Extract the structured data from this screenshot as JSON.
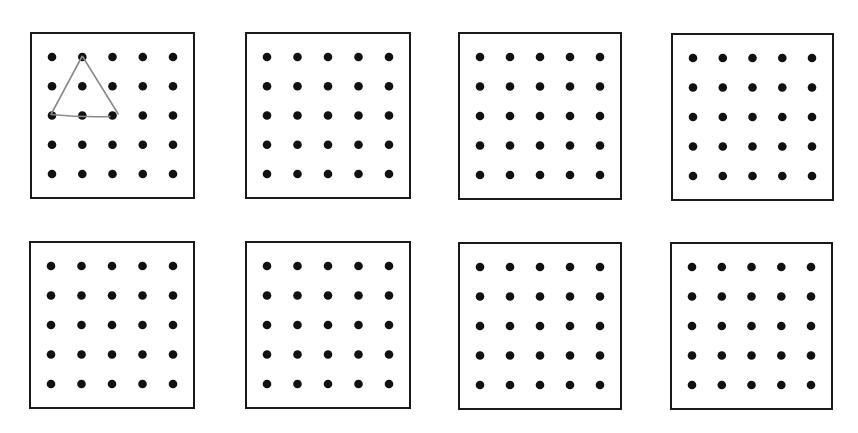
{
  "diagram": {
    "type": "dot-grid geoboards",
    "grid": {
      "rows": 5,
      "cols": 5
    },
    "colors": {
      "border": "#1a1a1a",
      "peg": "#111111",
      "shape_stroke": "#8a8a8a",
      "background": "#ffffff"
    },
    "boards": [
      {
        "id": 1,
        "box": {
          "x": 30,
          "y": 32,
          "w": 165,
          "h": 167
        },
        "shape": {
          "type": "triangle",
          "points_grid": [
            [
              1,
              0
            ],
            [
              0,
              2
            ],
            [
              2,
              2
            ]
          ],
          "description": "hand-drawn triangle connecting peg (col 1,row 0) to (col 0,row 2) to (col 2,row 2)"
        }
      },
      {
        "id": 2,
        "box": {
          "x": 245,
          "y": 32,
          "w": 166,
          "h": 167
        },
        "shape": null
      },
      {
        "id": 3,
        "box": {
          "x": 458,
          "y": 32,
          "w": 164,
          "h": 168
        },
        "shape": null
      },
      {
        "id": 4,
        "box": {
          "x": 671,
          "y": 33,
          "w": 163,
          "h": 168
        },
        "shape": null
      },
      {
        "id": 5,
        "box": {
          "x": 29,
          "y": 241,
          "w": 166,
          "h": 168
        },
        "shape": null
      },
      {
        "id": 6,
        "box": {
          "x": 245,
          "y": 241,
          "w": 166,
          "h": 168
        },
        "shape": null
      },
      {
        "id": 7,
        "box": {
          "x": 458,
          "y": 242,
          "w": 164,
          "h": 168
        },
        "shape": null
      },
      {
        "id": 8,
        "box": {
          "x": 670,
          "y": 242,
          "w": 163,
          "h": 168
        },
        "shape": null
      }
    ]
  }
}
